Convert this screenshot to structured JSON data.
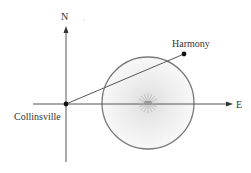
{
  "diagram": {
    "labels": {
      "north": "N",
      "east": "E",
      "origin": "Collinsville",
      "point": "Harmony"
    },
    "colors": {
      "axis": "#555555",
      "circle_stroke": "#7a7a7a",
      "circle_fill_center": "#e2e2e2",
      "circle_fill_edge": "#f7f7f7",
      "point": "#111111",
      "text": "#333333"
    },
    "icons": {
      "center_marker": "starburst-icon"
    }
  }
}
